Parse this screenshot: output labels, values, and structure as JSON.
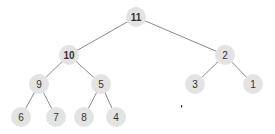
{
  "diagram": {
    "type": "binary-tree",
    "colors": {
      "node_fill": "#e3e3e3",
      "edge": "#8a8a8a",
      "label": "#333333"
    },
    "nodes": [
      {
        "id": "n11",
        "label": "11",
        "x": 136,
        "y": 17,
        "bold": true
      },
      {
        "id": "n10",
        "label": "10",
        "x": 69,
        "y": 55,
        "bold": true
      },
      {
        "id": "n2",
        "label": "2",
        "x": 225,
        "y": 55,
        "bold": false
      },
      {
        "id": "n9",
        "label": "9",
        "x": 39,
        "y": 84,
        "bold": false
      },
      {
        "id": "n5",
        "label": "5",
        "x": 101,
        "y": 84,
        "bold": false
      },
      {
        "id": "n3",
        "label": "3",
        "x": 195,
        "y": 84,
        "bold": false
      },
      {
        "id": "n1",
        "label": "1",
        "x": 253,
        "y": 84,
        "bold": false
      },
      {
        "id": "n6",
        "label": "6",
        "x": 21,
        "y": 117,
        "bold": false
      },
      {
        "id": "n7",
        "label": "7",
        "x": 56,
        "y": 117,
        "bold": false
      },
      {
        "id": "n8",
        "label": "8",
        "x": 84,
        "y": 117,
        "bold": false
      },
      {
        "id": "n4",
        "label": "4",
        "x": 116,
        "y": 117,
        "bold": false
      }
    ],
    "edges": [
      {
        "from": "n11",
        "to": "n10"
      },
      {
        "from": "n11",
        "to": "n2"
      },
      {
        "from": "n10",
        "to": "n9"
      },
      {
        "from": "n10",
        "to": "n5"
      },
      {
        "from": "n2",
        "to": "n3"
      },
      {
        "from": "n2",
        "to": "n1"
      },
      {
        "from": "n9",
        "to": "n6"
      },
      {
        "from": "n9",
        "to": "n7"
      },
      {
        "from": "n5",
        "to": "n8"
      },
      {
        "from": "n5",
        "to": "n4"
      }
    ],
    "node_radius": 10,
    "stray_mark": {
      "x": 181,
      "y": 106
    }
  }
}
